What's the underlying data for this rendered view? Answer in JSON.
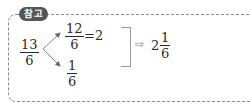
{
  "badge": {
    "label": "참고"
  },
  "source_fraction": {
    "numerator": "13",
    "denominator": "6"
  },
  "branches": [
    {
      "numerator": "12",
      "denominator": "6",
      "result": "=2"
    },
    {
      "numerator": "1",
      "denominator": "6"
    }
  ],
  "implication_symbol": "⇨",
  "mixed_number": {
    "whole": "2",
    "numerator": "1",
    "denominator": "6"
  },
  "colors": {
    "badge_bg": "#555555",
    "border": "#8a8a8a",
    "text": "#2a2a2a"
  }
}
